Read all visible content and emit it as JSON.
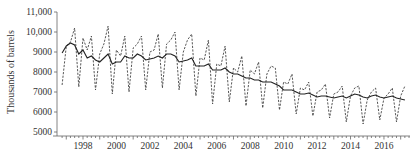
{
  "chart_data": {
    "type": "line",
    "title": "",
    "xlabel": "",
    "ylabel": "Thousands of barrels",
    "ylim": [
      5000,
      11000
    ],
    "xlim": [
      1996.55,
      2017.65
    ],
    "grid": false,
    "legend": null,
    "y_ticks": [
      {
        "value": 5000,
        "label": "5000"
      },
      {
        "value": 6000,
        "label": "6000"
      },
      {
        "value": 7000,
        "label": "7000"
      },
      {
        "value": 8000,
        "label": "8000"
      },
      {
        "value": 9000,
        "label": "9000"
      },
      {
        "value": 10000,
        "label": "10,000"
      },
      {
        "value": 11000,
        "label": "11,000"
      }
    ],
    "x_ticks": [
      {
        "value": 1998,
        "label": "1998"
      },
      {
        "value": 2000,
        "label": "2000"
      },
      {
        "value": 2002,
        "label": "2002"
      },
      {
        "value": 2004,
        "label": "2004"
      },
      {
        "value": 2006,
        "label": "2006"
      },
      {
        "value": 2008,
        "label": "2008"
      },
      {
        "value": 2010,
        "label": "2010"
      },
      {
        "value": 2012,
        "label": "2012"
      },
      {
        "value": 2014,
        "label": "2014"
      },
      {
        "value": 2016,
        "label": "2016"
      }
    ],
    "x_minor_tick_step": 0.25,
    "x_start": 1996.75,
    "x_step": 0.25,
    "series": [
      {
        "name": "Actual",
        "style": "dashed",
        "values": [
          7350,
          9300,
          9500,
          10200,
          7250,
          9700,
          9100,
          9800,
          7100,
          8900,
          9400,
          10300,
          6900,
          9100,
          8800,
          9800,
          7000,
          9200,
          9400,
          9800,
          7100,
          9000,
          9100,
          9900,
          7200,
          9400,
          9600,
          10000,
          7100,
          9000,
          9600,
          9900,
          6800,
          8700,
          8600,
          9600,
          6400,
          8400,
          8300,
          9300,
          6500,
          8200,
          8000,
          8800,
          6300,
          8100,
          7900,
          8500,
          6200,
          7900,
          8300,
          8200,
          6100,
          7500,
          7400,
          7900,
          5900,
          7200,
          7100,
          7500,
          5800,
          7000,
          7100,
          7400,
          5700,
          6900,
          7000,
          7300,
          5500,
          6800,
          7200,
          7300,
          5400,
          6600,
          7000,
          7200,
          5600,
          6700,
          6900,
          7200,
          5500,
          6800,
          7300
        ]
      },
      {
        "name": "Trend",
        "style": "solid",
        "values": [
          8950,
          9300,
          9450,
          9350,
          8900,
          9100,
          8700,
          8800,
          8600,
          8500,
          8700,
          8900,
          8400,
          8500,
          8500,
          8800,
          8700,
          8700,
          8900,
          8800,
          8600,
          8650,
          8700,
          8800,
          8700,
          8900,
          8900,
          8800,
          8500,
          8550,
          8600,
          8700,
          8300,
          8300,
          8300,
          8400,
          8100,
          8100,
          8100,
          8200,
          8000,
          7900,
          7900,
          7800,
          7700,
          7700,
          7600,
          7600,
          7500,
          7500,
          7500,
          7400,
          7300,
          7100,
          7100,
          7100,
          7000,
          6900,
          6900,
          6950,
          6850,
          6750,
          6800,
          6800,
          6750,
          6700,
          6750,
          6800,
          6700,
          6800,
          6900,
          6850,
          6750,
          6700,
          6800,
          6850,
          6750,
          6700,
          6750,
          6800,
          6700,
          6650,
          6600
        ]
      }
    ]
  }
}
